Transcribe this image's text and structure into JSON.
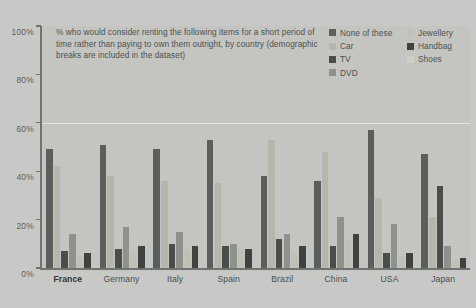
{
  "title": "% who would consider renting the following items for a short period of time rather than paying to own them outright, by country (demographic breaks are included in the dataset)",
  "axis": {
    "y_ticks": [
      "100%",
      "80%",
      "60%",
      "40%",
      "20%",
      "0%"
    ],
    "ylim": [
      0,
      100
    ]
  },
  "legend": {
    "column_1": [
      "None of these",
      "Car",
      "TV",
      "DVD"
    ],
    "column_2": [
      "Jewellery",
      "Handbag",
      "Shoes"
    ]
  },
  "colors": {
    "none_of_these": "#5a5f5c",
    "car": "#b6b6ad",
    "tv": "#4a4e4b",
    "dvd": "#8e918c",
    "jewellery": "#c0c0b6",
    "handbag": "#3f4340",
    "shoes": "#cfcfc4",
    "background": "#c8c8c6",
    "panel": "#c4c4c1",
    "axis": "#6f7370",
    "gridline": "#eceae2",
    "text": "#4e524f"
  },
  "selected_country": "France",
  "chart_data": {
    "type": "bar",
    "title": "% who would consider renting the following items for a short period of time rather than paying to own them outright, by country (demographic breaks are included in the dataset)",
    "xlabel": "",
    "ylabel": "",
    "ylim": [
      0,
      100
    ],
    "grid": true,
    "legend_position": "top-right",
    "categories": [
      "France",
      "Germany",
      "Italy",
      "Spain",
      "Brazil",
      "China",
      "USA",
      "Japan"
    ],
    "series": [
      {
        "name": "None of these",
        "color": "#5a5f5c",
        "values": [
          49,
          51,
          49,
          53,
          38,
          36,
          57,
          47
        ]
      },
      {
        "name": "Car",
        "color": "#b6b6ad",
        "values": [
          42,
          38,
          36,
          35,
          53,
          48,
          29,
          21
        ]
      },
      {
        "name": "TV",
        "color": "#4a4e4b",
        "values": [
          7,
          8,
          10,
          9,
          12,
          9,
          6,
          34
        ]
      },
      {
        "name": "DVD",
        "color": "#8e918c",
        "values": [
          14,
          17,
          15,
          10,
          14,
          21,
          18,
          9
        ]
      },
      {
        "name": "Jewellery",
        "color": "#c0c0b6",
        "values": [
          5,
          6,
          8,
          8,
          6,
          12,
          5,
          3
        ]
      },
      {
        "name": "Handbag",
        "color": "#3f4340",
        "values": [
          6,
          9,
          9,
          8,
          9,
          14,
          6,
          4
        ]
      }
    ]
  }
}
